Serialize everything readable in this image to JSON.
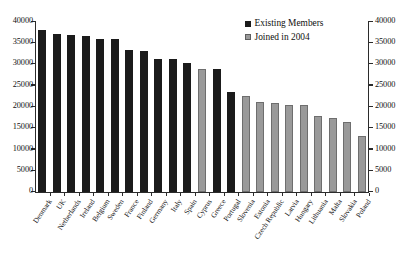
{
  "chart_data": {
    "type": "bar",
    "title": "",
    "xlabel": "",
    "ylabel": "",
    "ylim": [
      0,
      40000
    ],
    "ytick_labels": [
      "40000",
      "35000",
      "30000",
      "25000",
      "20000",
      "15000",
      "10000",
      "5000",
      "0"
    ],
    "ytick_values": [
      40000,
      35000,
      30000,
      25000,
      20000,
      15000,
      10000,
      5000,
      0
    ],
    "dual_axis": true,
    "right_axis_ytick_labels": [
      "40000",
      "35000",
      "30000",
      "25000",
      "20000",
      "15000",
      "10000",
      "5000",
      "0"
    ],
    "grid": false,
    "legend_position": "top-right",
    "legend": [
      {
        "name": "Existing Members",
        "color": "#1b1b1b"
      },
      {
        "name": "Joined in 2004",
        "color": "#9a9a9a"
      }
    ],
    "categories": [
      "Denmark",
      "UK",
      "Netherlands",
      "Ireland",
      "Belgium",
      "Sweden",
      "France",
      "Finland",
      "Germany",
      "Italy",
      "Spain",
      "Cyprus",
      "Greece",
      "Portugal",
      "Slovenia",
      "Estonia",
      "Czech Republic",
      "Latvia",
      "Hungary",
      "Lithuania",
      "Malta",
      "Slovakia",
      "Poland"
    ],
    "values": [
      37800,
      37000,
      36700,
      36400,
      35700,
      35700,
      33100,
      32900,
      31200,
      31000,
      30100,
      28700,
      28800,
      23400,
      22500,
      21000,
      20700,
      20400,
      20400,
      17700,
      17200,
      16300,
      13100
    ],
    "groups": [
      "Existing Members",
      "Existing Members",
      "Existing Members",
      "Existing Members",
      "Existing Members",
      "Existing Members",
      "Existing Members",
      "Existing Members",
      "Existing Members",
      "Existing Members",
      "Existing Members",
      "Joined in 2004",
      "Existing Members",
      "Existing Members",
      "Joined in 2004",
      "Joined in 2004",
      "Joined in 2004",
      "Joined in 2004",
      "Joined in 2004",
      "Joined in 2004",
      "Joined in 2004",
      "Joined in 2004",
      "Joined in 2004"
    ]
  }
}
